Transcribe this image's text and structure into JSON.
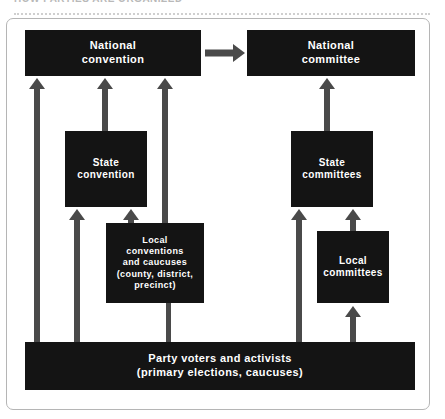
{
  "page": {
    "clipped_header_text": "HOW PARTIES ARE ORGANIZED",
    "background_color": "#ffffff",
    "frame_color": "#b5b5b5",
    "node_color": "#141414",
    "node_text_color": "#ffffff",
    "arrow_color": "#4a4a4a"
  },
  "diagram": {
    "type": "flow-diagram",
    "nodes": [
      {
        "id": "national-convention",
        "label": "National\nconvention",
        "line1": "National",
        "line2": "convention",
        "column": "left",
        "level": 1
      },
      {
        "id": "national-committee",
        "label": "National\ncommittee",
        "line1": "National",
        "line2": "committee",
        "column": "right",
        "level": 1
      },
      {
        "id": "state-convention",
        "label": "State\nconvention",
        "line1": "State",
        "line2": "convention",
        "column": "left",
        "level": 2
      },
      {
        "id": "state-committees",
        "label": "State\ncommittees",
        "line1": "State",
        "line2": "committees",
        "column": "right",
        "level": 2
      },
      {
        "id": "local-conventions",
        "label": "Local conventions and caucuses (county, district, precinct)",
        "line1": "Local",
        "line2": "conventions",
        "line3": "and caucuses",
        "line4": "(county, district,",
        "line5": "precinct)",
        "column": "left",
        "level": 3
      },
      {
        "id": "local-committees",
        "label": "Local\ncommittees",
        "line1": "Local",
        "line2": "committees",
        "column": "right",
        "level": 3
      },
      {
        "id": "party-voters",
        "label": "Party voters and activists (primary elections, caucuses)",
        "line1": "Party voters and activists",
        "line2": "(primary elections, caucuses)",
        "column": "full",
        "level": 4
      }
    ],
    "edges": [
      {
        "id": "e1",
        "from": "national-convention",
        "to": "national-committee",
        "direction": "right"
      },
      {
        "id": "e2",
        "from": "party-voters",
        "to": "national-convention",
        "direction": "up"
      },
      {
        "id": "e3",
        "from": "state-convention",
        "to": "national-convention",
        "direction": "up"
      },
      {
        "id": "e4",
        "from": "local-conventions",
        "to": "national-convention",
        "direction": "up"
      },
      {
        "id": "e5",
        "from": "party-voters",
        "to": "state-convention",
        "direction": "up"
      },
      {
        "id": "e6",
        "from": "local-conventions",
        "to": "state-convention",
        "direction": "up"
      },
      {
        "id": "e7",
        "from": "party-voters",
        "to": "local-conventions",
        "direction": "up"
      },
      {
        "id": "e8",
        "from": "state-committees",
        "to": "national-committee",
        "direction": "up"
      },
      {
        "id": "e9",
        "from": "party-voters",
        "to": "state-committees",
        "direction": "up"
      },
      {
        "id": "e10",
        "from": "local-committees",
        "to": "state-committees",
        "direction": "up"
      },
      {
        "id": "e11",
        "from": "party-voters",
        "to": "local-committees",
        "direction": "up"
      }
    ]
  }
}
